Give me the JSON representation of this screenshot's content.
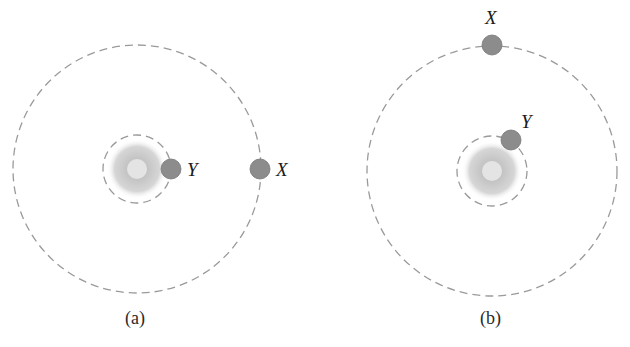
{
  "figure": {
    "panels": [
      {
        "caption": "(a)",
        "center": [
          137,
          169
        ],
        "outer_orbit_radius": 124,
        "inner_orbit_radius": 34,
        "bodies": [
          {
            "label": "Y",
            "position": [
              171,
              169
            ]
          },
          {
            "label": "X",
            "position": [
              260,
              169
            ]
          }
        ]
      },
      {
        "caption": "(b)",
        "center": [
          492,
          171
        ],
        "outer_orbit_radius": 125,
        "inner_orbit_radius": 35,
        "bodies": [
          {
            "label": "X",
            "position": [
              492,
              45
            ]
          },
          {
            "label": "Y",
            "position": [
              511,
              140
            ]
          }
        ]
      }
    ],
    "colors": {
      "orbit": "#9a9a9a",
      "body_fill": "#8c8c8c",
      "body_stroke": "#6e6e6e",
      "star_core": "#e2e2e2",
      "star_glow": "#b8b8b8"
    }
  }
}
